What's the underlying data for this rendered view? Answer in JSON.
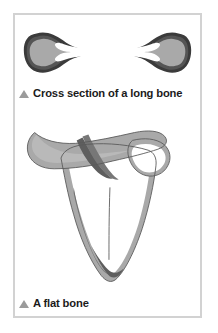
{
  "page": {
    "background_color": "#ffffff",
    "frame_border_color": "#d2d2d2",
    "frame_background": "#ffffff"
  },
  "palette": {
    "cortex_outline": "#333333",
    "cortex_dark": "#4a4a4a",
    "spongy_mid_gray": "#7d7d7d",
    "spongy_light_gray": "#a9a9a9",
    "marrow_white": "#ffffff",
    "caption_text": "#1b1b1b",
    "caption_bullet": "#9b9b9b"
  },
  "figures": [
    {
      "id": "long-bone",
      "art_name": "long-bone-cross-section-illustration",
      "caption": {
        "bullet_icon": "triangle-up-icon",
        "text": "Cross section of a long bone"
      }
    },
    {
      "id": "flat-bone",
      "art_name": "flat-bone-scapula-illustration",
      "caption": {
        "bullet_icon": "triangle-up-icon",
        "text": "A flat bone"
      }
    }
  ]
}
